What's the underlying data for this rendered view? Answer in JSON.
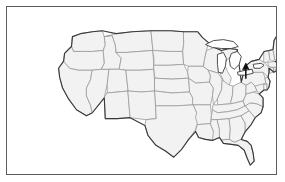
{
  "figure": {
    "kind": "map",
    "title": "",
    "region": "United States",
    "projection": "albers-usa-like",
    "frame": {
      "visible": true,
      "border_color": "#5d5d5d",
      "background_color": "#ffffff"
    },
    "style": {
      "state_fill": "#f2f2f2",
      "state_border": "#9a9a9a",
      "nation_border": "#3a3a3a",
      "lake_fill": "#ffffff",
      "annotation_color": "#0b0b0b"
    }
  },
  "annotations": [
    {
      "name": "north-arrow-pointer",
      "type": "arrow",
      "direction": "up",
      "tip_x": 248,
      "tip_y": 64,
      "tail_x": 248,
      "tail_y": 80,
      "label": "",
      "points_at": "Northeast coast"
    }
  ],
  "water_bodies": [
    {
      "name": "Lake Superior"
    },
    {
      "name": "Lake Michigan"
    },
    {
      "name": "Lake Huron"
    },
    {
      "name": "Lake Erie"
    },
    {
      "name": "Lake Ontario"
    }
  ],
  "states": [
    {
      "code": "WA",
      "name": "Washington"
    },
    {
      "code": "OR",
      "name": "Oregon"
    },
    {
      "code": "CA",
      "name": "California"
    },
    {
      "code": "NV",
      "name": "Nevada"
    },
    {
      "code": "ID",
      "name": "Idaho"
    },
    {
      "code": "MT",
      "name": "Montana"
    },
    {
      "code": "WY",
      "name": "Wyoming"
    },
    {
      "code": "UT",
      "name": "Utah"
    },
    {
      "code": "AZ",
      "name": "Arizona"
    },
    {
      "code": "CO",
      "name": "Colorado"
    },
    {
      "code": "NM",
      "name": "New Mexico"
    },
    {
      "code": "ND",
      "name": "North Dakota"
    },
    {
      "code": "SD",
      "name": "South Dakota"
    },
    {
      "code": "NE",
      "name": "Nebraska"
    },
    {
      "code": "KS",
      "name": "Kansas"
    },
    {
      "code": "OK",
      "name": "Oklahoma"
    },
    {
      "code": "TX",
      "name": "Texas"
    },
    {
      "code": "MN",
      "name": "Minnesota"
    },
    {
      "code": "IA",
      "name": "Iowa"
    },
    {
      "code": "MO",
      "name": "Missouri"
    },
    {
      "code": "AR",
      "name": "Arkansas"
    },
    {
      "code": "LA",
      "name": "Louisiana"
    },
    {
      "code": "WI",
      "name": "Wisconsin"
    },
    {
      "code": "IL",
      "name": "Illinois"
    },
    {
      "code": "MI",
      "name": "Michigan"
    },
    {
      "code": "IN",
      "name": "Indiana"
    },
    {
      "code": "OH",
      "name": "Ohio"
    },
    {
      "code": "KY",
      "name": "Kentucky"
    },
    {
      "code": "TN",
      "name": "Tennessee"
    },
    {
      "code": "MS",
      "name": "Mississippi"
    },
    {
      "code": "AL",
      "name": "Alabama"
    },
    {
      "code": "GA",
      "name": "Georgia"
    },
    {
      "code": "FL",
      "name": "Florida"
    },
    {
      "code": "SC",
      "name": "South Carolina"
    },
    {
      "code": "NC",
      "name": "North Carolina"
    },
    {
      "code": "VA",
      "name": "Virginia"
    },
    {
      "code": "WV",
      "name": "West Virginia"
    },
    {
      "code": "MD",
      "name": "Maryland"
    },
    {
      "code": "DE",
      "name": "Delaware"
    },
    {
      "code": "PA",
      "name": "Pennsylvania"
    },
    {
      "code": "NJ",
      "name": "New Jersey"
    },
    {
      "code": "NY",
      "name": "New York"
    },
    {
      "code": "CT",
      "name": "Connecticut"
    },
    {
      "code": "RI",
      "name": "Rhode Island"
    },
    {
      "code": "MA",
      "name": "Massachusetts"
    },
    {
      "code": "VT",
      "name": "Vermont"
    },
    {
      "code": "NH",
      "name": "New Hampshire"
    },
    {
      "code": "ME",
      "name": "Maine"
    }
  ]
}
